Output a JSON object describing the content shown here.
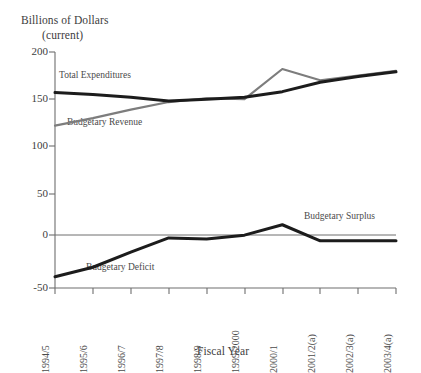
{
  "chart_data": {
    "type": "line",
    "title": "",
    "ylabel": "Billions of Dollars (current)",
    "ylabel_line1": "Billions of Dollars",
    "ylabel_line2": "(current)",
    "xlabel": "Fiscal Year",
    "categories": [
      "1994/5",
      "1995/6",
      "1996/7",
      "1997/8",
      "1998/9",
      "1999/2000",
      "2000/1",
      "2001/2(a)",
      "2002/3(a)",
      "2003/4(a)"
    ],
    "ylim": [
      -50,
      200
    ],
    "yticks": [
      200,
      150,
      100,
      50,
      0,
      -50
    ],
    "ytick_labels": [
      "200",
      "150",
      "100",
      "50",
      "0",
      "-50"
    ],
    "grid": false,
    "legend_position": "inline-annotations",
    "series": [
      {
        "name": "Total Expenditures",
        "color": "#1c1c1c",
        "width": 3.0,
        "values": [
          157,
          155,
          152,
          148,
          150,
          152,
          158,
          168,
          174,
          179
        ]
      },
      {
        "name": "Budgetary Revenue",
        "color": "#7d7d7d",
        "width": 2.2,
        "values": [
          122,
          130,
          139,
          147,
          151,
          150,
          182,
          170,
          175,
          180
        ]
      },
      {
        "name": "Budgetary Deficit / Surplus",
        "color": "#1c1c1c",
        "width": 3.0,
        "values": [
          -38,
          -28,
          -12,
          3,
          2,
          6,
          17,
          0,
          0,
          0
        ]
      }
    ],
    "zero_line": {
      "value": 0,
      "color": "#6e6e6e"
    },
    "annotations": [
      {
        "text": "Total Expenditures",
        "x_index": 0,
        "y": 165
      },
      {
        "text": "Budgetary Revenue",
        "x_index": 0,
        "y": 113
      },
      {
        "text": "Budgetary Deficit",
        "x_index": 1,
        "y": -28
      },
      {
        "text": "Budgetary Surplus",
        "x_index": 7,
        "y": 22
      }
    ]
  },
  "axes": {
    "y_axis_color": "#6e6e6e",
    "x_axis_color": "#6e6e6e"
  }
}
